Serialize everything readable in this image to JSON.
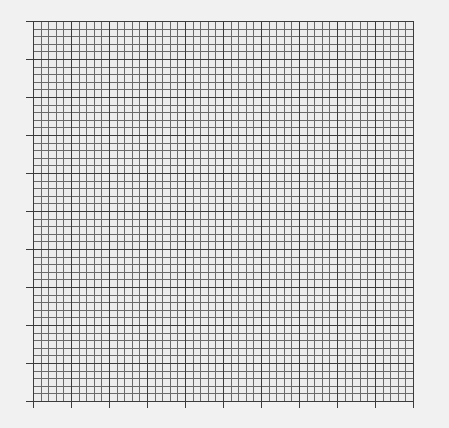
{
  "graph_paper": {
    "origin_x": 33,
    "origin_y": 21,
    "major_divisions_x": 10,
    "major_divisions_y": 10,
    "minor_per_major": 5,
    "major_cell_px": 38,
    "tick_length_px": 7,
    "colors": {
      "background": "#f1f1f1",
      "cell_fill": "#ececec",
      "minor_line": "#6a6a6a",
      "major_line": "#3c3c3c"
    }
  }
}
